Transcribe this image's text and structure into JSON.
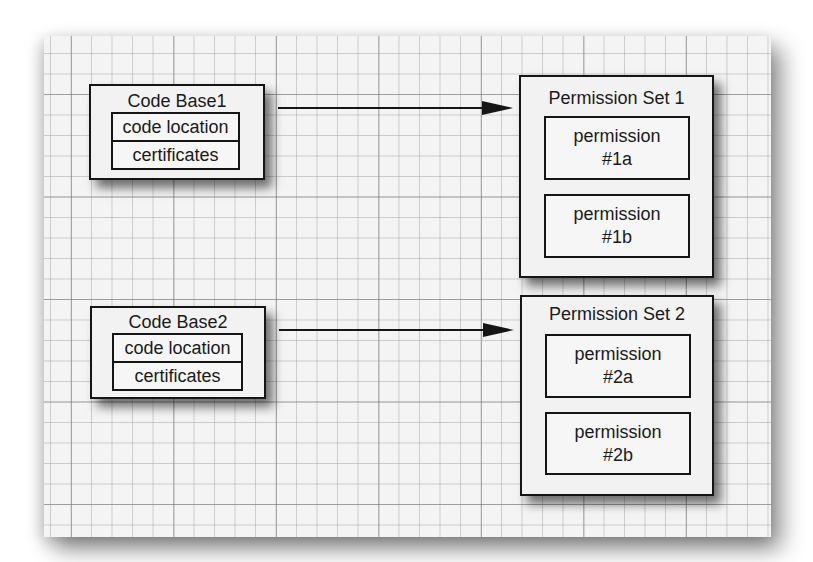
{
  "code_bases": [
    {
      "title": "Code Base1",
      "fields": [
        "code location",
        "certificates"
      ]
    },
    {
      "title": "Code Base2",
      "fields": [
        "code location",
        "certificates"
      ]
    }
  ],
  "permission_sets": [
    {
      "title": "Permission Set 1",
      "permissions": [
        {
          "line1": "permission",
          "line2": "#1a"
        },
        {
          "line1": "permission",
          "line2": "#1b"
        }
      ]
    },
    {
      "title": "Permission Set 2",
      "permissions": [
        {
          "line1": "permission",
          "line2": "#2a"
        },
        {
          "line1": "permission",
          "line2": "#2b"
        }
      ]
    }
  ],
  "arrows": [
    {
      "from": "Code Base1",
      "to": "Permission Set 1"
    },
    {
      "from": "Code Base2",
      "to": "Permission Set 2"
    }
  ],
  "colors": {
    "line": "#151515",
    "box_fill": "#f2f2f2",
    "grid_background": "#f4f4f4"
  }
}
